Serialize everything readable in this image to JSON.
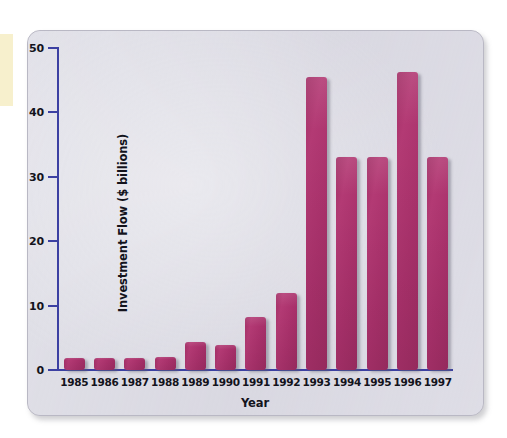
{
  "figure": {
    "panel_background": "#dddce4",
    "axis_color": "#3c40a2",
    "bar_color": "#a8316a"
  },
  "chart_data": {
    "type": "bar",
    "title": "",
    "xlabel": "Year",
    "ylabel": "Investment Flow ($ billions)",
    "categories": [
      "1985",
      "1986",
      "1987",
      "1988",
      "1989",
      "1990",
      "1991",
      "1992",
      "1993",
      "1994",
      "1995",
      "1996",
      "1997"
    ],
    "values": [
      1.8,
      1.8,
      1.9,
      2.0,
      4.3,
      3.9,
      8.3,
      11.9,
      45.5,
      33.0,
      33.0,
      46.2,
      33.0
    ],
    "ylim": [
      0,
      50
    ],
    "yticks": [
      0,
      10,
      20,
      30,
      40,
      50
    ],
    "ytick_labels": [
      "0",
      "10",
      "20",
      "30",
      "40",
      "50"
    ],
    "grid": false,
    "legend": null,
    "series": [
      {
        "name": "Investment Flow",
        "values": [
          1.8,
          1.8,
          1.9,
          2.0,
          4.3,
          3.9,
          8.3,
          11.9,
          45.5,
          33.0,
          33.0,
          46.2,
          33.0
        ]
      }
    ]
  }
}
